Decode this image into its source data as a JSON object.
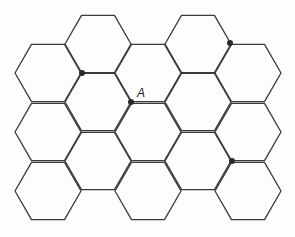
{
  "diagram": {
    "type": "hexagonal-grid",
    "side_length": 33,
    "stroke_color": "#3a3a3a",
    "dot_color": "#2a2a2a",
    "hexagons": [
      {
        "cx": 48,
        "cy": 73
      },
      {
        "cx": 48,
        "cy": 132
      },
      {
        "cx": 48,
        "cy": 191
      },
      {
        "cx": 98,
        "cy": 44
      },
      {
        "cx": 98,
        "cy": 102
      },
      {
        "cx": 98,
        "cy": 161
      },
      {
        "cx": 148,
        "cy": 73
      },
      {
        "cx": 148,
        "cy": 132
      },
      {
        "cx": 148,
        "cy": 191
      },
      {
        "cx": 198,
        "cy": 44
      },
      {
        "cx": 198,
        "cy": 102
      },
      {
        "cx": 198,
        "cy": 161
      },
      {
        "cx": 248,
        "cy": 73
      },
      {
        "cx": 248,
        "cy": 132
      },
      {
        "cx": 248,
        "cy": 191
      }
    ],
    "points": [
      {
        "x": 82,
        "y": 73,
        "label": ""
      },
      {
        "x": 131,
        "y": 102,
        "label": "A"
      },
      {
        "x": 230,
        "y": 43,
        "label": ""
      },
      {
        "x": 232,
        "y": 161,
        "label": ""
      }
    ],
    "label_A": "A"
  }
}
